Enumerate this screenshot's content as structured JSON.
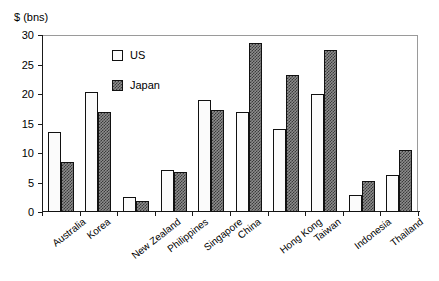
{
  "chart_data": {
    "type": "bar",
    "title": "",
    "xlabel": "",
    "ylabel": "$ (bns)",
    "ylim": [
      0,
      30
    ],
    "yticks": [
      0,
      5,
      10,
      15,
      20,
      25,
      30
    ],
    "ytick_labels": [
      "0",
      "5",
      "10",
      "15",
      "20",
      "25",
      "30"
    ],
    "grid": false,
    "legend_position": "upper-left-inside",
    "categories": [
      "Australia",
      "Korea",
      "New Zealand",
      "Philippines",
      "Singapore",
      "China",
      "Hong Kong",
      "Taiwan",
      "Indonesia",
      "Thailand"
    ],
    "series": [
      {
        "name": "US",
        "pattern": "light-dotted",
        "color": "#fbfbfb",
        "values": [
          13.6,
          20.4,
          2.6,
          7.2,
          19.0,
          17.0,
          14.0,
          20.0,
          2.8,
          6.3
        ]
      },
      {
        "name": "Japan",
        "pattern": "dark-checkered",
        "color": "#8d8d8d",
        "values": [
          8.5,
          17.0,
          1.8,
          6.7,
          17.3,
          28.7,
          23.3,
          27.4,
          5.3,
          10.5
        ]
      }
    ]
  },
  "legend": {
    "entries": [
      {
        "label": "US"
      },
      {
        "label": "Japan"
      }
    ]
  }
}
